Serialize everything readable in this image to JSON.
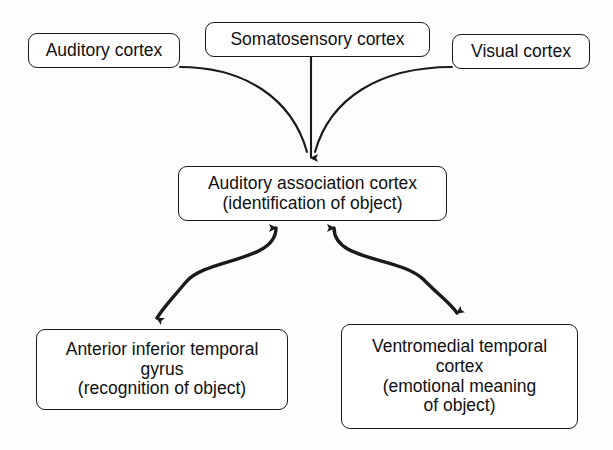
{
  "diagram": {
    "line_color": "#1a1a1a",
    "background_color": "#fdfdfd",
    "nodes": [
      {
        "id": "auditory-cortex",
        "lines": [
          "Auditory cortex"
        ]
      },
      {
        "id": "somatosensory-cortex",
        "lines": [
          "Somatosensory cortex"
        ]
      },
      {
        "id": "visual-cortex",
        "lines": [
          "Visual cortex"
        ]
      },
      {
        "id": "auditory-association-cortex",
        "lines": [
          "Auditory association cortex",
          "(identification of object)"
        ]
      },
      {
        "id": "anterior-inferior-temporal-gyrus",
        "lines": [
          "Anterior inferior temporal",
          "gyrus",
          "(recognition of object)"
        ]
      },
      {
        "id": "ventromedial-temporal-cortex",
        "lines": [
          "Ventromedial temporal",
          "cortex",
          "(emotional meaning",
          "of object)"
        ]
      }
    ],
    "connectors": [
      {
        "id": "auditory-to-association",
        "from": "auditory-cortex",
        "to": "auditory-association-cortex",
        "style": "curved",
        "arrowheads": "end"
      },
      {
        "id": "somatosensory-to-association",
        "from": "somatosensory-cortex",
        "to": "auditory-association-cortex",
        "style": "straight",
        "arrowheads": "end"
      },
      {
        "id": "visual-to-association",
        "from": "visual-cortex",
        "to": "auditory-association-cortex",
        "style": "curved",
        "arrowheads": "end"
      },
      {
        "id": "association-to-anterior-gyrus",
        "from": "auditory-association-cortex",
        "to": "anterior-inferior-temporal-gyrus",
        "style": "s-curve",
        "arrowheads": "both"
      },
      {
        "id": "association-to-ventromedial-cortex",
        "from": "auditory-association-cortex",
        "to": "ventromedial-temporal-cortex",
        "style": "s-curve",
        "arrowheads": "both"
      }
    ]
  }
}
